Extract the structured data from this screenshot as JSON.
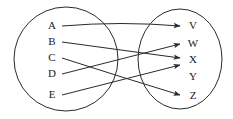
{
  "diagram": {
    "type": "mapping-diagram",
    "stroke_color": "#2a2a2a",
    "label_color": "#1a1a1a",
    "background_color": "#ffffff",
    "domain_set": {
      "name": "left-set",
      "shape": "ellipse",
      "center_x": 66,
      "center_y": 59,
      "radius_x": 52,
      "radius_y": 52,
      "elements": [
        {
          "label": "A",
          "x": 52,
          "y": 26
        },
        {
          "label": "B",
          "x": 52,
          "y": 42
        },
        {
          "label": "C",
          "x": 52,
          "y": 58
        },
        {
          "label": "D",
          "x": 52,
          "y": 74
        },
        {
          "label": "E",
          "x": 52,
          "y": 95
        }
      ]
    },
    "codomain_set": {
      "name": "right-set",
      "shape": "ellipse",
      "center_x": 180,
      "center_y": 59,
      "radius_x": 42,
      "radius_y": 50,
      "elements": [
        {
          "label": "V",
          "x": 193,
          "y": 26
        },
        {
          "label": "W",
          "x": 193,
          "y": 44
        },
        {
          "label": "X",
          "x": 193,
          "y": 60
        },
        {
          "label": "Y",
          "x": 193,
          "y": 77
        },
        {
          "label": "Z",
          "x": 193,
          "y": 96
        }
      ]
    },
    "edges": [
      {
        "name": "edge-a-to-v",
        "from": "A",
        "to": "V",
        "x1": 62,
        "y1": 26,
        "x2": 180,
        "y2": 26,
        "curve_y": 21
      },
      {
        "name": "edge-b-to-x",
        "from": "B",
        "to": "X",
        "x1": 62,
        "y1": 42,
        "x2": 180,
        "y2": 58,
        "curve_y": 50
      },
      {
        "name": "edge-c-to-z",
        "from": "C",
        "to": "Z",
        "x1": 62,
        "y1": 58,
        "x2": 180,
        "y2": 95,
        "curve_y": 77
      },
      {
        "name": "edge-d-to-w",
        "from": "D",
        "to": "W",
        "x1": 62,
        "y1": 74,
        "x2": 180,
        "y2": 44,
        "curve_y": 59
      },
      {
        "name": "edge-e-to-x",
        "from": "E",
        "to": "X",
        "x1": 62,
        "y1": 95,
        "x2": 180,
        "y2": 65,
        "curve_y": 80
      }
    ],
    "unmapped_targets": [
      "Y"
    ]
  }
}
